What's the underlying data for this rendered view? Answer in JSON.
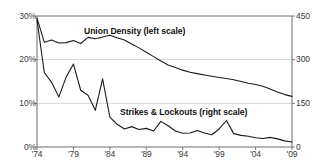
{
  "chart_data": {
    "type": "line",
    "title": "",
    "xlabel": "",
    "ylabel": "",
    "grid": true,
    "legend_position": "inline-annotations",
    "x": [
      1974,
      1975,
      1976,
      1977,
      1978,
      1979,
      1980,
      1981,
      1982,
      1983,
      1984,
      1985,
      1986,
      1987,
      1988,
      1989,
      1990,
      1991,
      1992,
      1993,
      1994,
      1995,
      1996,
      1997,
      1998,
      1999,
      2000,
      2001,
      2002,
      2003,
      2004,
      2005,
      2006,
      2007,
      2008,
      2009
    ],
    "x_tick_labels": [
      "'74",
      "'79",
      "'84",
      "'89",
      "'94",
      "'99",
      "'04",
      "'09"
    ],
    "x_tick_values": [
      1974,
      1979,
      1984,
      1989,
      1994,
      1999,
      2004,
      2009
    ],
    "axes": [
      {
        "id": "left",
        "name": "Union Density",
        "ylim": [
          0,
          30
        ],
        "tick_labels": [
          "0%",
          "10%",
          "20%",
          "30%"
        ],
        "tick_values": [
          0,
          10,
          20,
          30
        ],
        "unit": "percent"
      },
      {
        "id": "right",
        "name": "Strikes & Lockouts",
        "ylim": [
          0,
          450
        ],
        "tick_labels": [
          "0",
          "150",
          "300",
          "450"
        ],
        "tick_values": [
          0,
          150,
          300,
          450
        ],
        "unit": "count"
      }
    ],
    "series": [
      {
        "name": "Union Density (left scale)",
        "axis": "left",
        "color": "#1a1a1a",
        "values": [
          29.5,
          24.0,
          24.5,
          23.8,
          23.9,
          24.4,
          23.7,
          25.1,
          24.8,
          25.2,
          25.6,
          25.0,
          24.5,
          23.6,
          22.7,
          21.7,
          20.7,
          19.7,
          18.8,
          18.2,
          17.6,
          17.1,
          16.8,
          16.5,
          16.2,
          15.9,
          15.7,
          15.4,
          15.0,
          14.6,
          14.3,
          13.9,
          13.3,
          12.6,
          12.0,
          11.6
        ]
      },
      {
        "name": "Strikes & Lockouts (right scale)",
        "axis": "right",
        "color": "#1a1a1a",
        "values": [
          437,
          256,
          222,
          172,
          240,
          285,
          195,
          178,
          126,
          234,
          103,
          78,
          62,
          70,
          60,
          64,
          55,
          88,
          73,
          55,
          47,
          48,
          57,
          48,
          42,
          62,
          91,
          46,
          40,
          37,
          32,
          29,
          33,
          28,
          21,
          17
        ]
      }
    ],
    "annotations": [
      {
        "id": "union-density",
        "text": "Union Density (left scale)"
      },
      {
        "id": "strikes-lockouts",
        "text": "Strikes & Lockouts (right scale)"
      }
    ]
  }
}
